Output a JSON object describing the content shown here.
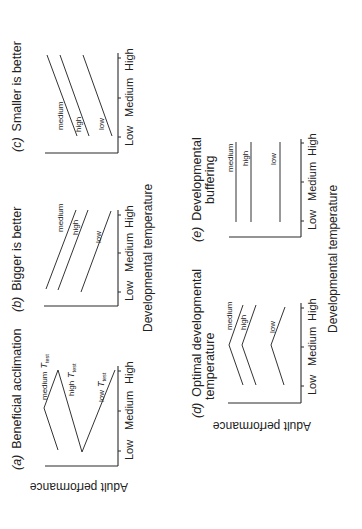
{
  "figure": {
    "orientation": "rotated 90 degrees counter-clockwise",
    "shared_axis_labels": {
      "y": "Adult performance",
      "x": "Developmental temperature"
    },
    "panels": [
      {
        "id": "a",
        "label": "(a)",
        "title": "Beneficial acclimation",
        "ticks": [
          "Low",
          "Medium",
          "High"
        ],
        "series": [
          {
            "name": "medium",
            "prefix": "T",
            "subscript": "test",
            "pattern": "peak at Medium"
          },
          {
            "name": "high",
            "prefix": "T",
            "subscript": "test",
            "pattern": "decreasing Low to Medium"
          },
          {
            "name": "low",
            "prefix": "T",
            "subscript": "test",
            "pattern": "increasing Medium to High"
          }
        ]
      },
      {
        "id": "b",
        "label": "(b)",
        "title": "Bigger is better",
        "ticks": [
          "Low",
          "Medium",
          "High"
        ],
        "series": [
          {
            "name": "medium",
            "pattern": "increasing"
          },
          {
            "name": "high",
            "pattern": "increasing"
          },
          {
            "name": "low",
            "pattern": "increasing"
          }
        ]
      },
      {
        "id": "c",
        "label": "(c)",
        "title": "Smaller is better",
        "ticks": [
          "Low",
          "Medium",
          "High"
        ],
        "series": [
          {
            "name": "medium",
            "pattern": "decreasing"
          },
          {
            "name": "high",
            "pattern": "decreasing"
          },
          {
            "name": "low",
            "pattern": "decreasing"
          }
        ]
      },
      {
        "id": "d",
        "label": "(d)",
        "title_line1": "Optimal developmental",
        "title_line2": "temperature",
        "ticks": [
          "Low",
          "Medium",
          "High"
        ],
        "series": [
          {
            "name": "medium",
            "pattern": "peak at Medium"
          },
          {
            "name": "high",
            "pattern": "peak at Medium"
          },
          {
            "name": "low",
            "pattern": "peak at Medium"
          }
        ]
      },
      {
        "id": "e",
        "label": "(e)",
        "title_line1": "Developmental",
        "title_line2": "buffering",
        "ticks": [
          "Low",
          "Medium",
          "High"
        ],
        "series": [
          {
            "name": "medium",
            "pattern": "flat"
          },
          {
            "name": "high",
            "pattern": "flat"
          },
          {
            "name": "low",
            "pattern": "flat"
          }
        ]
      }
    ]
  }
}
